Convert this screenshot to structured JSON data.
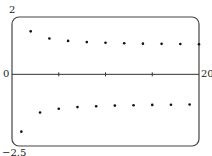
{
  "chart_data": {
    "type": "scatter",
    "title": "",
    "xlabel": "",
    "ylabel": "",
    "xlim": [
      0,
      20
    ],
    "ylim": [
      -2.5,
      2
    ],
    "tick_labels": {
      "y_top": "2",
      "y_origin": "0",
      "y_bottom": "-2.5",
      "x_right": "20"
    },
    "x_ticks": [
      5,
      10,
      15
    ],
    "grid": false,
    "legend": null,
    "x": [
      1,
      2,
      3,
      4,
      5,
      6,
      7,
      8,
      9,
      10,
      11,
      12,
      13,
      14,
      15,
      16,
      17,
      18,
      19,
      20
    ],
    "series": [
      {
        "name": "a_n = (-1)^n (1 + 1/n)",
        "values": [
          -2,
          1.5,
          -1.333,
          1.25,
          -1.2,
          1.167,
          -1.143,
          1.125,
          -1.111,
          1.1,
          -1.091,
          1.083,
          -1.077,
          1.071,
          -1.067,
          1.063,
          -1.059,
          1.056,
          -1.053,
          1.05
        ]
      }
    ]
  }
}
